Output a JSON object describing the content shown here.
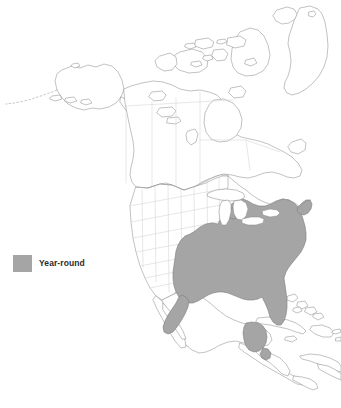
{
  "map": {
    "title": "North America range map",
    "background_color": "#ffffff",
    "coastline_color": "#8f8f8f",
    "border_color": "#c9c9c9",
    "state_border_color": "#cfcfcf",
    "range_fill_color": "#a5a5a5",
    "range_outline_color": "#7d7d7d",
    "water_color": "#ffffff",
    "projection_note": "North America, Central America, Caribbean, Greenland",
    "regions_shaded": [
      "Eastern United States",
      "Gulf Coast",
      "Florida",
      "New England",
      "Eastern Texas",
      "Yucatan Peninsula",
      "Belize"
    ],
    "regions_outlined": [
      "Alaska",
      "Canada",
      "Greenland",
      "Canadian Arctic Archipelago",
      "Western United States",
      "Mexico",
      "Central America",
      "Cuba",
      "Bahamas",
      "Hispaniola",
      "Puerto Rico",
      "Jamaica",
      "Northern South America"
    ]
  },
  "legend": {
    "swatch_color": "#a5a5a5",
    "items": [
      {
        "label": "Year-round",
        "color": "#a5a5a5"
      }
    ]
  }
}
